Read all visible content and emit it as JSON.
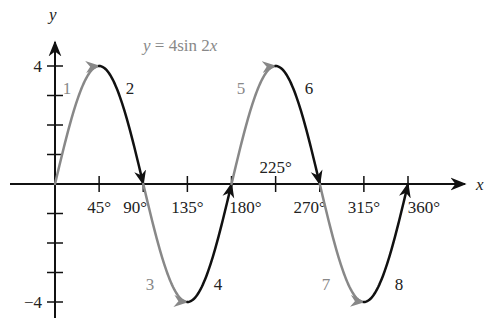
{
  "chart_data": {
    "type": "line",
    "title": "y = 4sin 2x",
    "xlabel": "x",
    "ylabel": "y",
    "equation": {
      "prefix": "y = 4",
      "func": "sin 2",
      "var": "x"
    },
    "x_ticks": [
      {
        "value": 45,
        "label": "45°"
      },
      {
        "value": 90,
        "label": "90°"
      },
      {
        "value": 135,
        "label": "135°"
      },
      {
        "value": 180,
        "label": "180°"
      },
      {
        "value": 225,
        "label": "225°"
      },
      {
        "value": 270,
        "label": "270°"
      },
      {
        "value": 315,
        "label": "315°"
      },
      {
        "value": 360,
        "label": "360°"
      }
    ],
    "y_ticks": [
      -4,
      -3,
      -2,
      -1,
      1,
      2,
      3,
      4
    ],
    "y_tick_labels": [
      {
        "value": 4,
        "label": "4"
      },
      {
        "value": -4,
        "label": "−4"
      }
    ],
    "xlim": [
      0,
      360
    ],
    "ylim": [
      -4,
      4
    ],
    "grid": false,
    "amplitude": 4,
    "period_deg": 180,
    "x": [
      0,
      45,
      90,
      135,
      180,
      225,
      270,
      315,
      360
    ],
    "y": [
      0,
      4,
      0,
      -4,
      0,
      4,
      0,
      -4,
      0
    ],
    "segments": [
      {
        "label": "1",
        "from": 0,
        "to": 45,
        "color": "#888888"
      },
      {
        "label": "2",
        "from": 45,
        "to": 90,
        "color": "#111111"
      },
      {
        "label": "3",
        "from": 90,
        "to": 135,
        "color": "#888888"
      },
      {
        "label": "4",
        "from": 135,
        "to": 180,
        "color": "#111111"
      },
      {
        "label": "5",
        "from": 180,
        "to": 225,
        "color": "#888888"
      },
      {
        "label": "6",
        "from": 225,
        "to": 270,
        "color": "#111111"
      },
      {
        "label": "7",
        "from": 270,
        "to": 315,
        "color": "#888888"
      },
      {
        "label": "8",
        "from": 315,
        "to": 360,
        "color": "#111111"
      }
    ]
  }
}
